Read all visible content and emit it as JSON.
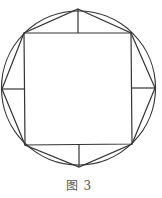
{
  "caption": "图 3",
  "colors": {
    "stroke": "#333333",
    "background": "#ffffff",
    "caption": "#555555"
  },
  "geometry": {
    "circle": {
      "cx": 78.5,
      "cy": 88,
      "r": 77
    },
    "square": [
      [
        24,
        33
      ],
      [
        131,
        33
      ],
      [
        132,
        144
      ],
      [
        25,
        145
      ]
    ],
    "octagon": [
      [
        78,
        9
      ],
      [
        131,
        33
      ],
      [
        155,
        88
      ],
      [
        132,
        144
      ],
      [
        79,
        167
      ],
      [
        25,
        145
      ],
      [
        2,
        89
      ],
      [
        24,
        33
      ]
    ],
    "spokes": [
      {
        "from": [
          78,
          33
        ],
        "to": [
          78,
          9
        ]
      },
      {
        "from": [
          132,
          88
        ],
        "to": [
          155,
          88
        ]
      },
      {
        "from": [
          79,
          145
        ],
        "to": [
          79,
          167
        ]
      },
      {
        "from": [
          24,
          89
        ],
        "to": [
          2,
          89
        ]
      }
    ]
  }
}
